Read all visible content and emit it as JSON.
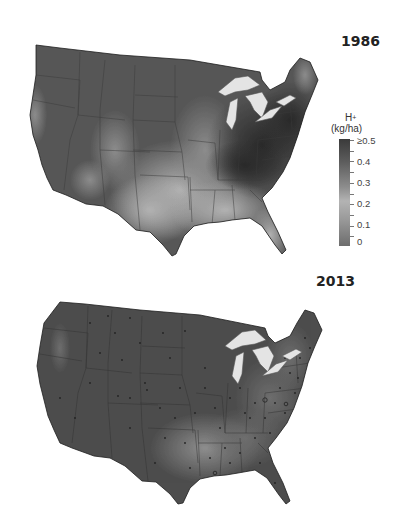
{
  "maps": [
    {
      "year": "1986",
      "description": "Acid deposition (H+) across contiguous United States",
      "colors": {
        "base": "#575757",
        "high": "#2f2f2f",
        "low": "#a8a8a8"
      }
    },
    {
      "year": "2013",
      "description": "Acid deposition (H+) across contiguous United States with monitoring stations",
      "colors": {
        "base": "#4d4d4d",
        "high": "#4a4a4a",
        "low": "#8e8e8e"
      }
    }
  ],
  "legend": {
    "title_main": "H",
    "title_sup": "+",
    "unit": "(kg/ha)",
    "ticks": [
      "≥0.5",
      "0.4",
      "0.3",
      "0.2",
      "0.1",
      "0"
    ],
    "colors": {
      "max": "#3a3a3a",
      "mid": "#b3b3b3",
      "min": "#6d6d6d"
    }
  }
}
